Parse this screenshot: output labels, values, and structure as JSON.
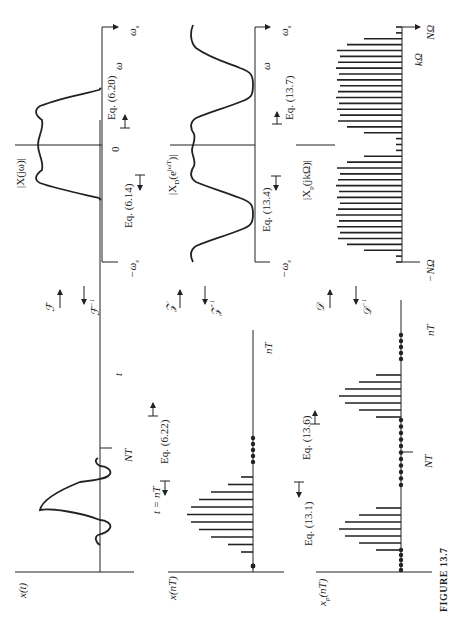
{
  "figure": {
    "caption": "FIGURE 13.7",
    "orientation": "rotated 90 degrees counter-clockwise"
  },
  "panels": {
    "ct_spectrum": {
      "ylabel": "|X(jω)|",
      "origin_label": "0",
      "axis_var": "ω",
      "pos_limit": "ω",
      "pos_limit_sub": "s",
      "neg_limit": "−ω",
      "neg_limit_sub": "s",
      "eq_left": "Eq. (6.14)",
      "eq_right": "Eq. (6.20)"
    },
    "dt_spectrum": {
      "ylabel": "|X",
      "ylabel_sub": "D",
      "ylabel_rest": "(e",
      "ylabel_sup": "jωT",
      "ylabel_end": ")|",
      "axis_var": "ω",
      "pos_limit": "ω",
      "pos_limit_sub": "s",
      "neg_limit": "−ω",
      "neg_limit_sub": "s",
      "eq_left": "Eq. (13.4)",
      "eq_right": "Eq. (13.7)"
    },
    "dft_spectrum": {
      "ylabel": "|X",
      "ylabel_sub": "p",
      "ylabel_rest": "(jkΩ)|",
      "mid_label": "kΩ",
      "pos_limit": "NΩ",
      "neg_limit": "−NΩ",
      "num_lines": 41
    },
    "ct_signal": {
      "ylabel": "x(t)",
      "axis_var": "t",
      "period_marker": "NT",
      "eq": "Eq. (6.22)",
      "sampling_label": "t = nT"
    },
    "dt_signal": {
      "ylabel": "x(nT)",
      "axis_var": "nT"
    },
    "periodic_signal": {
      "ylabel": "x",
      "ylabel_sub": "p",
      "ylabel_rest": "(nT)",
      "axis_var": "nT",
      "period_marker": "NT",
      "eq_left": "Eq. (13.1)",
      "eq_right": "Eq. (13.6)"
    }
  },
  "transforms": [
    {
      "forward": "ℱ",
      "inverse": "ℱ",
      "inverse_sup": "−1"
    },
    {
      "forward": "𝒵",
      "inverse": "𝒵",
      "inverse_sup": "−1"
    },
    {
      "forward": "𝒟",
      "inverse": "𝒟",
      "inverse_sup": "−1"
    }
  ]
}
